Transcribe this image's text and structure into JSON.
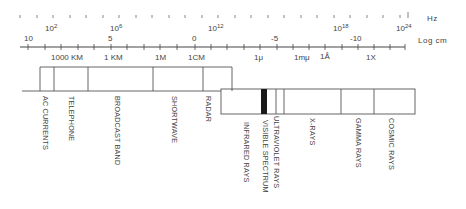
{
  "diagram": {
    "frequency_axis": {
      "unit": "Hz",
      "ticks_major": [
        {
          "base": "10",
          "exp": "2",
          "x": 52
        },
        {
          "base": "10",
          "exp": "6",
          "x": 118
        },
        {
          "base": "10",
          "exp": "12",
          "x": 218
        },
        {
          "base": "10",
          "exp": "18",
          "x": 342
        },
        {
          "base": "10",
          "exp": "24",
          "x": 405
        }
      ],
      "colors": {
        "start": "#444444",
        "mid": "#b9d9a0",
        "end": "#6a5cc9"
      }
    },
    "wavelength_axis": {
      "unit": "Log cm",
      "ticks_major": [
        {
          "label": "10",
          "x": 28
        },
        {
          "label": "5",
          "x": 110
        },
        {
          "label": "0",
          "x": 195
        },
        {
          "label": "-5",
          "x": 276
        },
        {
          "label": "-10",
          "x": 356
        }
      ]
    },
    "wavelength_markers": [
      {
        "label": "1000 KM",
        "x": 66
      },
      {
        "label": "1 KM",
        "x": 112
      },
      {
        "label": "1M",
        "x": 160
      },
      {
        "label": "1CM",
        "x": 194
      },
      {
        "label": "1μ",
        "x": 258
      },
      {
        "label": "1mμ",
        "x": 301
      },
      {
        "label": "1Å",
        "x": 324
      },
      {
        "label": "1X",
        "x": 369
      }
    ],
    "bands_upper": [
      {
        "label": "AC CURRENTS",
        "x": 46
      },
      {
        "label": "TELEPHONE",
        "x": 72
      },
      {
        "label": "BROADCAST BAND",
        "x": 118
      },
      {
        "label": "SHORTWAVE",
        "x": 174
      },
      {
        "label": "RADAR",
        "x": 208
      }
    ],
    "bands_lower": [
      {
        "label": "INFRARED RAYS",
        "x": 246
      },
      {
        "label": "VISIBLE SPECTRUM",
        "x": 265
      },
      {
        "label": "ULTRAVIOLET RAYS",
        "x": 275
      },
      {
        "label": "X-RAYS",
        "x": 312
      },
      {
        "label": "GAMMA RAYS",
        "x": 358
      },
      {
        "label": "COSMIC RAYS",
        "x": 391
      }
    ]
  }
}
